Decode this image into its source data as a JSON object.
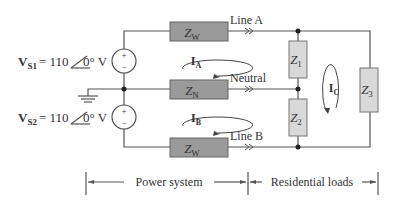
{
  "sources": [
    {
      "id": "vs1",
      "label_main": "V",
      "label_sub": "S1",
      "value": "= 110",
      "angle": "0°",
      "unit": "V",
      "polarity_top": "+",
      "polarity_bottom": "−"
    },
    {
      "id": "vs2",
      "label_main": "V",
      "label_sub": "S2",
      "value": "= 110",
      "angle": "0°",
      "unit": "V",
      "polarity_top": "+",
      "polarity_bottom": "−"
    }
  ],
  "lines": {
    "line_a": "Line A",
    "neutral": "Neutral",
    "line_b": "Line B"
  },
  "impedances": {
    "zw_top": {
      "main": "Z",
      "sub": "W"
    },
    "zn": {
      "main": "Z",
      "sub": "N"
    },
    "zw_bottom": {
      "main": "Z",
      "sub": "W"
    },
    "z1": {
      "main": "Z",
      "sub": "1"
    },
    "z2": {
      "main": "Z",
      "sub": "2"
    },
    "z3": {
      "main": "Z",
      "sub": "3"
    }
  },
  "currents": {
    "ia": {
      "main": "I",
      "sub": "A"
    },
    "ib": {
      "main": "I",
      "sub": "B"
    },
    "ic": {
      "main": "I",
      "sub": "C"
    }
  },
  "sections": {
    "power_system": "Power system",
    "residential_loads": "Residential loads"
  },
  "colors": {
    "wire": "#555555",
    "impedance_dark": "#9a9a9a",
    "impedance_light": "#d9d9d9",
    "text": "#333333"
  }
}
